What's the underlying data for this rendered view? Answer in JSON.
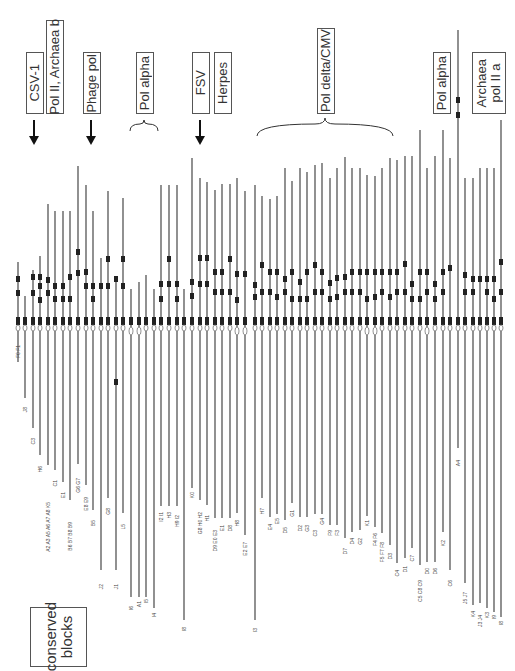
{
  "figure": {
    "orientation": "rotated-90",
    "line_color": "#555555",
    "marker_color": "#222222",
    "center_band_y": 323,
    "legend": {
      "label": "conserved\nblocks"
    }
  },
  "groups": [
    {
      "id": "csv1",
      "label": "CSV-1",
      "box": [
        26,
        52,
        16,
        60
      ],
      "indicator": "arrow",
      "indicator_x": 34
    },
    {
      "id": "pol2-archaea-b",
      "label": "Pol II, Archaea b",
      "box": [
        46,
        20,
        16,
        92
      ],
      "indicator": "none"
    },
    {
      "id": "phage-pol",
      "label": "Phage pol",
      "box": [
        83,
        52,
        16,
        60
      ],
      "indicator": "arrow",
      "indicator_x": 91
    },
    {
      "id": "pol-alpha-1",
      "label": "Pol alpha",
      "box": [
        136,
        52,
        16,
        60
      ],
      "indicator": "brace",
      "indicator_x": 144
    },
    {
      "id": "fsv",
      "label": "FSV",
      "box": [
        192,
        52,
        16,
        60
      ],
      "indicator": "arrow",
      "indicator_x": 200
    },
    {
      "id": "herpes",
      "label": "Herpes",
      "box": [
        214,
        52,
        16,
        60
      ],
      "indicator": "none"
    },
    {
      "id": "pol-delta-cmv",
      "label": "Pol delta/CMV",
      "box": [
        317,
        28,
        16,
        84
      ],
      "indicator": "brace-wide",
      "indicator_x": 325
    },
    {
      "id": "pol-alpha-2",
      "label": "Pol alpha",
      "box": [
        433,
        52,
        16,
        60
      ],
      "indicator": "none"
    },
    {
      "id": "archaea-pol2-a",
      "label": "Archaea\npol II a",
      "box": [
        472,
        52,
        32,
        60
      ],
      "indicator": "none"
    }
  ],
  "lanes": [
    {
      "x": 18,
      "top": 262,
      "bottom": 362,
      "marks": [
        279,
        293
      ],
      "label": "F0 F1",
      "label_y": 345,
      "oval": false
    },
    {
      "x": 25,
      "top": 296,
      "bottom": 398,
      "marks": [],
      "label": "J8",
      "label_y": 407,
      "oval": false
    },
    {
      "x": 33,
      "top": 270,
      "bottom": 428,
      "marks": [
        277,
        293
      ],
      "label": "C3",
      "label_y": 438,
      "oval": false
    },
    {
      "x": 40,
      "top": 256,
      "bottom": 455,
      "marks": [
        277,
        286,
        300
      ],
      "label": "H6",
      "label_y": 466,
      "oval": false
    },
    {
      "x": 48,
      "top": 204,
      "bottom": 465,
      "marks": [
        280,
        293
      ],
      "label": "A2 A3 A5 A6 A7 A8 K5",
      "label_y": 502,
      "oval": false
    },
    {
      "x": 55,
      "top": 211,
      "bottom": 470,
      "marks": [
        286,
        299
      ],
      "label": "C1",
      "label_y": 480,
      "oval": false
    },
    {
      "x": 63,
      "top": 211,
      "bottom": 482,
      "marks": [
        286,
        299
      ],
      "label": "E1",
      "label_y": 492,
      "oval": false
    },
    {
      "x": 70,
      "top": 211,
      "bottom": 500,
      "marks": [
        277,
        299
      ],
      "label": "B6 B7 B8 B9",
      "label_y": 522,
      "oval": false
    },
    {
      "x": 78,
      "top": 166,
      "bottom": 464,
      "marks": [
        252,
        273
      ],
      "label": "G6 G7",
      "label_y": 478,
      "oval": false
    },
    {
      "x": 86,
      "top": 185,
      "bottom": 485,
      "marks": [
        272,
        286
      ],
      "label": "E8 E9",
      "label_y": 497,
      "oval": false
    },
    {
      "x": 93,
      "top": 211,
      "bottom": 510,
      "marks": [
        286,
        299
      ],
      "label": "B5",
      "label_y": 520,
      "oval": false
    },
    {
      "x": 101,
      "top": 258,
      "bottom": 570,
      "marks": [
        286
      ],
      "label": "J2",
      "label_y": 584,
      "oval": false
    },
    {
      "x": 108,
      "top": 191,
      "bottom": 498,
      "marks": [
        259,
        286
      ],
      "label": "G8",
      "label_y": 508,
      "oval": false
    },
    {
      "x": 116,
      "top": 276,
      "bottom": 570,
      "marks": [
        279,
        382
      ],
      "label": "J1",
      "label_y": 584,
      "oval": false
    },
    {
      "x": 123,
      "top": 198,
      "bottom": 513,
      "marks": [
        259,
        286
      ],
      "label": "L5",
      "label_y": 524,
      "oval": false
    },
    {
      "x": 131,
      "top": 289,
      "bottom": 597,
      "marks": [],
      "label": "I6",
      "label_y": 606,
      "oval": true
    },
    {
      "x": 139,
      "top": 282,
      "bottom": 597,
      "marks": [],
      "label": "A1",
      "label_y": 601,
      "oval": true
    },
    {
      "x": 146,
      "top": 275,
      "bottom": 597,
      "marks": [],
      "label": "I5",
      "label_y": 599,
      "oval": false
    },
    {
      "x": 154,
      "top": 289,
      "bottom": 608,
      "marks": [],
      "label": "I4",
      "label_y": 613,
      "oval": false
    },
    {
      "x": 161,
      "top": 185,
      "bottom": 506,
      "marks": [
        284,
        299
      ],
      "label": "I2 I1",
      "label_y": 512,
      "oval": false
    },
    {
      "x": 169,
      "top": 185,
      "bottom": 506,
      "marks": [
        259,
        284
      ],
      "label": "H3",
      "label_y": 512,
      "oval": false
    },
    {
      "x": 177,
      "top": 185,
      "bottom": 506,
      "marks": [
        284,
        299
      ],
      "label": "H9 I2",
      "label_y": 515,
      "oval": false
    },
    {
      "x": 184,
      "top": 289,
      "bottom": 620,
      "marks": [],
      "label": "I8",
      "label_y": 627,
      "oval": false
    },
    {
      "x": 192,
      "top": 158,
      "bottom": 488,
      "marks": [
        282,
        296
      ],
      "label": "K0",
      "label_y": 492,
      "oval": false
    },
    {
      "x": 200,
      "top": 178,
      "bottom": 500,
      "marks": [
        258,
        284
      ],
      "label": "G8 H0 H2",
      "label_y": 512,
      "oval": false
    },
    {
      "x": 207,
      "top": 182,
      "bottom": 505,
      "marks": [
        258,
        284
      ],
      "label": "H1",
      "label_y": 515,
      "oval": false
    },
    {
      "x": 215,
      "top": 190,
      "bottom": 518,
      "marks": [
        272,
        292
      ],
      "label": "D9 E0 E3",
      "label_y": 530,
      "oval": false
    },
    {
      "x": 222,
      "top": 184,
      "bottom": 518,
      "marks": [
        272,
        292
      ],
      "label": "E1",
      "label_y": 525,
      "oval": false
    },
    {
      "x": 230,
      "top": 184,
      "bottom": 518,
      "marks": [
        259,
        292
      ],
      "label": "D8",
      "label_y": 525,
      "oval": false
    },
    {
      "x": 237,
      "top": 178,
      "bottom": 513,
      "marks": [
        274,
        300
      ],
      "label": "H8",
      "label_y": 520,
      "oval": true
    },
    {
      "x": 245,
      "top": 191,
      "bottom": 535,
      "marks": [
        274
      ],
      "label": "E2 E7",
      "label_y": 542,
      "oval": true
    },
    {
      "x": 255,
      "top": 185,
      "bottom": 620,
      "marks": [
        285,
        297
      ],
      "label": "I3",
      "label_y": 628,
      "oval": false
    },
    {
      "x": 262,
      "top": 196,
      "bottom": 498,
      "marks": [
        265,
        292
      ],
      "label": "H7",
      "label_y": 508,
      "oval": false
    },
    {
      "x": 270,
      "top": 199,
      "bottom": 517,
      "marks": [
        272,
        292
      ],
      "label": "E4",
      "label_y": 524,
      "oval": false
    },
    {
      "x": 277,
      "top": 196,
      "bottom": 514,
      "marks": [
        272,
        297
      ],
      "label": "E5",
      "label_y": 518,
      "oval": false
    },
    {
      "x": 285,
      "top": 168,
      "bottom": 520,
      "marks": [
        279,
        292
      ],
      "label": "D5",
      "label_y": 527,
      "oval": false
    },
    {
      "x": 292,
      "top": 181,
      "bottom": 503,
      "marks": [
        272,
        299
      ],
      "label": "G1",
      "label_y": 510,
      "oval": false
    },
    {
      "x": 300,
      "top": 168,
      "bottom": 517,
      "marks": [
        282,
        299
      ],
      "label": "D2",
      "label_y": 525,
      "oval": false
    },
    {
      "x": 307,
      "top": 172,
      "bottom": 517,
      "marks": [
        272,
        299
      ],
      "label": "G3",
      "label_y": 525,
      "oval": false
    },
    {
      "x": 315,
      "top": 165,
      "bottom": 514,
      "marks": [
        265,
        292
      ],
      "label": "C3",
      "label_y": 530,
      "oval": false
    },
    {
      "x": 322,
      "top": 163,
      "bottom": 514,
      "marks": [
        272,
        292
      ],
      "label": "G4",
      "label_y": 518,
      "oval": false
    },
    {
      "x": 330,
      "top": 178,
      "bottom": 525,
      "marks": [
        283,
        299
      ],
      "label": "F9",
      "label_y": 530,
      "oval": false
    },
    {
      "x": 337,
      "top": 168,
      "bottom": 525,
      "marks": [
        278,
        297
      ],
      "label": "F3",
      "label_y": 530,
      "oval": false
    },
    {
      "x": 345,
      "top": 157,
      "bottom": 538,
      "marks": [
        277,
        292
      ],
      "label": "D7",
      "label_y": 548,
      "oval": false
    },
    {
      "x": 352,
      "top": 168,
      "bottom": 532,
      "marks": [
        272,
        292
      ],
      "label": "D4",
      "label_y": 538,
      "oval": false
    },
    {
      "x": 360,
      "top": 168,
      "bottom": 530,
      "marks": [
        272,
        292
      ],
      "label": "G2",
      "label_y": 538,
      "oval": false
    },
    {
      "x": 367,
      "top": 175,
      "bottom": 516,
      "marks": [
        272,
        299
      ],
      "label": "K1",
      "label_y": 520,
      "oval": true
    },
    {
      "x": 375,
      "top": 176,
      "bottom": 527,
      "marks": [
        272,
        297
      ],
      "label": "F4 F6",
      "label_y": 533,
      "oval": true
    },
    {
      "x": 382,
      "top": 168,
      "bottom": 533,
      "marks": [
        272,
        292
      ],
      "label": "F5 F7 F8",
      "label_y": 542,
      "oval": false
    },
    {
      "x": 390,
      "top": 158,
      "bottom": 545,
      "marks": [
        272,
        297
      ],
      "label": "D3",
      "label_y": 553,
      "oval": false
    },
    {
      "x": 397,
      "top": 160,
      "bottom": 563,
      "marks": [
        272,
        292
      ],
      "label": "C4",
      "label_y": 570,
      "oval": false
    },
    {
      "x": 405,
      "top": 156,
      "bottom": 558,
      "marks": [
        264,
        292
      ],
      "label": "D1",
      "label_y": 566,
      "oval": false
    },
    {
      "x": 412,
      "top": 156,
      "bottom": 548,
      "marks": [
        284,
        299
      ],
      "label": "C7",
      "label_y": 555,
      "oval": false
    },
    {
      "x": 420,
      "top": 130,
      "bottom": 565,
      "marks": [
        272,
        299
      ],
      "label": "C5 C8 C9",
      "label_y": 580,
      "oval": false
    },
    {
      "x": 427,
      "top": 168,
      "bottom": 562,
      "marks": [
        272,
        292
      ],
      "label": "D0",
      "label_y": 568,
      "oval": true
    },
    {
      "x": 435,
      "top": 156,
      "bottom": 562,
      "marks": [
        284,
        299
      ],
      "label": "D6",
      "label_y": 568,
      "oval": false
    },
    {
      "x": 443,
      "top": 130,
      "bottom": 532,
      "marks": [
        272,
        292
      ],
      "label": "K2",
      "label_y": 540,
      "oval": false
    },
    {
      "x": 450,
      "top": 158,
      "bottom": 570,
      "marks": [
        268
      ],
      "label": "C6",
      "label_y": 580,
      "oval": false
    },
    {
      "x": 458,
      "top": 30,
      "bottom": 448,
      "marks": [
        100,
        115
      ],
      "label": "A4",
      "label_y": 460,
      "oval": false
    },
    {
      "x": 465,
      "top": 178,
      "bottom": 583,
      "marks": [
        275,
        292
      ],
      "label": "J5 J7",
      "label_y": 592,
      "oval": false
    },
    {
      "x": 473,
      "top": 178,
      "bottom": 605,
      "marks": [
        279,
        292
      ],
      "label": "K4",
      "label_y": 611,
      "oval": false
    },
    {
      "x": 480,
      "top": 168,
      "bottom": 603,
      "marks": [
        279
      ],
      "label": "J3 J4",
      "label_y": 615,
      "oval": false
    },
    {
      "x": 487,
      "top": 168,
      "bottom": 608,
      "marks": [
        279,
        292
      ],
      "label": "K3",
      "label_y": 612,
      "oval": false
    },
    {
      "x": 494,
      "top": 168,
      "bottom": 612,
      "marks": [
        279,
        299
      ],
      "label": "I9",
      "label_y": 615,
      "oval": false
    },
    {
      "x": 501,
      "top": 120,
      "bottom": 617,
      "marks": [
        262,
        292
      ],
      "label": "I8",
      "label_y": 621,
      "oval": false
    }
  ]
}
